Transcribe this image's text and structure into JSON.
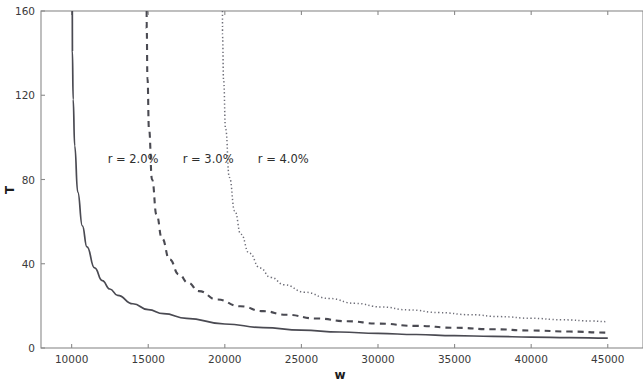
{
  "chart_data": {
    "type": "line",
    "title": "",
    "subtitle": "",
    "xlabel": "w",
    "ylabel": "T",
    "xlim": [
      8000,
      47300
    ],
    "ylim": [
      0,
      160
    ],
    "grid": false,
    "legend_position": "inline-annotations",
    "x_ticks": [
      10000,
      15000,
      20000,
      25000,
      30000,
      35000,
      40000,
      45000
    ],
    "x_tick_labels": [
      "10000",
      "15000",
      "20000",
      "25000",
      "30000",
      "35000",
      "40000",
      "45000"
    ],
    "y_ticks": [
      0,
      40,
      80,
      120,
      160
    ],
    "y_tick_labels": [
      "0",
      "40",
      "80",
      "120",
      "160"
    ],
    "series": [
      {
        "name": "r = 2.0%",
        "style": "solid",
        "color": "#4a4a52",
        "asymptote_w": 10000,
        "annotation": "r = 2.0%",
        "annotation_w": 12350,
        "annotation_T": 88,
        "x": [
          10050,
          10100,
          10200,
          10400,
          10700,
          11000,
          11500,
          12000,
          12500,
          13000,
          14000,
          15000,
          16000,
          17500,
          20000,
          22500,
          25000,
          27500,
          30000,
          32500,
          35000,
          37500,
          40000,
          42500,
          45000
        ],
        "values": [
          141,
          118,
          96,
          74,
          58,
          48,
          38,
          32,
          28,
          25,
          21,
          18.2,
          16.3,
          14.1,
          11.4,
          9.7,
          8.5,
          7.6,
          6.9,
          6.4,
          5.9,
          5.5,
          5.2,
          4.9,
          4.7
        ]
      },
      {
        "name": "r = 3.0%",
        "style": "dashed",
        "color": "#4a4a52",
        "asymptote_w": 14850,
        "annotation": "r = 3.0%",
        "annotation_w": 17250,
        "annotation_T": 88,
        "x": [
          14900,
          14950,
          15050,
          15250,
          15550,
          15900,
          16400,
          17000,
          17600,
          18300,
          19500,
          21000,
          22500,
          24000,
          26000,
          28000,
          30000,
          32500,
          35000,
          37500,
          40000,
          42500,
          45000
        ],
        "values": [
          152,
          128,
          104,
          80,
          63,
          52,
          42,
          35,
          31,
          27,
          23,
          19.8,
          17.5,
          15.8,
          14.0,
          12.7,
          11.6,
          10.5,
          9.6,
          8.9,
          8.3,
          7.8,
          7.3
        ]
      },
      {
        "name": "r = 4.0%",
        "style": "dotted",
        "color": "#6e6e78",
        "asymptote_w": 19800,
        "annotation": "r = 4.0%",
        "annotation_w": 22150,
        "annotation_T": 88,
        "x": [
          19850,
          19920,
          20050,
          20300,
          20650,
          21050,
          21600,
          22300,
          23000,
          23900,
          25200,
          26800,
          28500,
          30200,
          32000,
          34000,
          36000,
          38000,
          40000,
          42000,
          44000,
          45000
        ],
        "values": [
          148,
          127,
          104,
          81,
          65,
          54,
          45,
          38,
          33.5,
          30,
          26.5,
          23.5,
          21.2,
          19.5,
          18.1,
          16.8,
          15.8,
          14.9,
          14.1,
          13.4,
          12.8,
          12.5
        ]
      }
    ]
  }
}
